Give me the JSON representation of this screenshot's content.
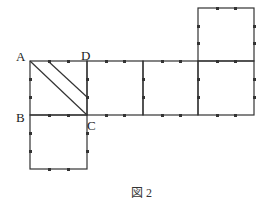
{
  "figure": {
    "caption": "図 2",
    "labels": {
      "A": "A",
      "B": "B",
      "C": "C",
      "D": "D"
    },
    "line_color": "#333333"
  }
}
